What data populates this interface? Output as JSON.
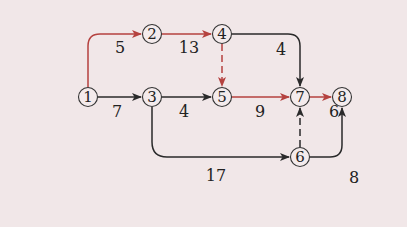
{
  "diagram": {
    "type": "network-diagram",
    "colors": {
      "background": "#f1e7e8",
      "critical": "#b5423f",
      "normal": "#333333"
    },
    "nodes": [
      {
        "id": "1",
        "label": "①",
        "x": 88,
        "y": 97
      },
      {
        "id": "2",
        "label": "②",
        "x": 152,
        "y": 34
      },
      {
        "id": "3",
        "label": "③",
        "x": 152,
        "y": 97
      },
      {
        "id": "4",
        "label": "④",
        "x": 222,
        "y": 34
      },
      {
        "id": "5",
        "label": "⑤",
        "x": 222,
        "y": 97
      },
      {
        "id": "6",
        "label": "⑥",
        "x": 300,
        "y": 157
      },
      {
        "id": "7",
        "label": "⑦",
        "x": 300,
        "y": 97
      },
      {
        "id": "8",
        "label": "⑧",
        "x": 342,
        "y": 97
      }
    ],
    "edges": [
      {
        "from": "1",
        "to": "2",
        "weight": "5",
        "critical": true,
        "dashed": false
      },
      {
        "from": "1",
        "to": "3",
        "weight": "7",
        "critical": false,
        "dashed": false
      },
      {
        "from": "2",
        "to": "4",
        "weight": "13",
        "critical": true,
        "dashed": false
      },
      {
        "from": "3",
        "to": "5",
        "weight": "4",
        "critical": false,
        "dashed": false
      },
      {
        "from": "3",
        "to": "6",
        "weight": "17",
        "critical": false,
        "dashed": false
      },
      {
        "from": "4",
        "to": "5",
        "weight": "",
        "critical": true,
        "dashed": true
      },
      {
        "from": "4",
        "to": "7",
        "weight": "4",
        "critical": false,
        "dashed": false
      },
      {
        "from": "5",
        "to": "7",
        "weight": "9",
        "critical": true,
        "dashed": false
      },
      {
        "from": "6",
        "to": "7",
        "weight": "",
        "critical": false,
        "dashed": true
      },
      {
        "from": "6",
        "to": "8",
        "weight": "8",
        "critical": false,
        "dashed": false
      },
      {
        "from": "7",
        "to": "8",
        "weight": "6",
        "critical": true,
        "dashed": false
      }
    ],
    "labels": {
      "n1": "1",
      "n2": "2",
      "n3": "3",
      "n4": "4",
      "n5": "5",
      "n6": "6",
      "n7": "7",
      "n8": "8",
      "e12": "5",
      "e13": "7",
      "e24": "13",
      "e35": "4",
      "e36": "17",
      "e47": "4",
      "e57": "9",
      "e68": "8",
      "e78": "6"
    }
  }
}
